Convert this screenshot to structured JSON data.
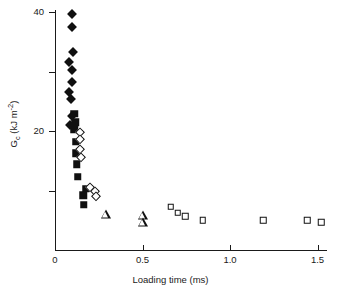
{
  "chart_data": {
    "type": "scatter",
    "title": "",
    "xlabel": "Loading time (ms)",
    "ylabel": "Gc (kJ m-2)",
    "ylabel_base": "G",
    "ylabel_sub": "c",
    "ylabel_unit_open": " (kJ m",
    "ylabel_sup": "-2",
    "ylabel_unit_close": ")",
    "xlim": [
      0,
      1.55
    ],
    "ylim": [
      0,
      42
    ],
    "grid": false,
    "legend": "none",
    "xticks": [
      {
        "value": 0,
        "label": "0"
      },
      {
        "value": 0.5,
        "label": "0.5"
      },
      {
        "value": 1.0,
        "label": "1.0"
      },
      {
        "value": 1.5,
        "label": "1.5"
      }
    ],
    "yticks": [
      {
        "value": 40,
        "label": "40"
      },
      {
        "value": 30,
        "label": ""
      },
      {
        "value": 20,
        "label": "20"
      },
      {
        "value": 10,
        "label": ""
      }
    ],
    "series": [
      {
        "name": "filled-diamond",
        "marker": "filled-diamond",
        "points": [
          {
            "x": 0.095,
            "y": 39.6
          },
          {
            "x": 0.095,
            "y": 37.4
          },
          {
            "x": 0.1,
            "y": 33.2
          },
          {
            "x": 0.08,
            "y": 31.6
          },
          {
            "x": 0.095,
            "y": 30.3
          },
          {
            "x": 0.095,
            "y": 28.3
          },
          {
            "x": 0.078,
            "y": 26.6
          },
          {
            "x": 0.09,
            "y": 25.3
          },
          {
            "x": 0.097,
            "y": 22.6
          },
          {
            "x": 0.088,
            "y": 21.0
          }
        ]
      },
      {
        "name": "filled-square",
        "marker": "filled-square",
        "points": [
          {
            "x": 0.11,
            "y": 22.9
          },
          {
            "x": 0.115,
            "y": 21.5
          },
          {
            "x": 0.11,
            "y": 20.3
          },
          {
            "x": 0.118,
            "y": 18.2
          },
          {
            "x": 0.118,
            "y": 16.3
          },
          {
            "x": 0.125,
            "y": 14.4
          },
          {
            "x": 0.13,
            "y": 12.3
          },
          {
            "x": 0.175,
            "y": 10.3
          },
          {
            "x": 0.16,
            "y": 9.2
          },
          {
            "x": 0.165,
            "y": 7.6
          }
        ]
      },
      {
        "name": "open-diamond",
        "marker": "open-diamond",
        "points": [
          {
            "x": 0.14,
            "y": 19.8
          },
          {
            "x": 0.143,
            "y": 18.6
          },
          {
            "x": 0.145,
            "y": 17.0
          },
          {
            "x": 0.148,
            "y": 15.6
          },
          {
            "x": 0.2,
            "y": 10.6
          },
          {
            "x": 0.23,
            "y": 10.0
          },
          {
            "x": 0.233,
            "y": 9.0
          }
        ]
      },
      {
        "name": "open-triangle",
        "marker": "open-triangle",
        "points": [
          {
            "x": 0.29,
            "y": 5.9
          },
          {
            "x": 0.5,
            "y": 5.7
          },
          {
            "x": 0.505,
            "y": 4.6
          }
        ]
      },
      {
        "name": "open-square",
        "marker": "open-square",
        "points": [
          {
            "x": 0.66,
            "y": 7.3
          },
          {
            "x": 0.7,
            "y": 6.3
          },
          {
            "x": 0.745,
            "y": 5.7
          },
          {
            "x": 0.845,
            "y": 5.0
          },
          {
            "x": 1.19,
            "y": 5.0
          },
          {
            "x": 1.44,
            "y": 5.0
          },
          {
            "x": 1.52,
            "y": 4.7
          }
        ]
      }
    ]
  }
}
